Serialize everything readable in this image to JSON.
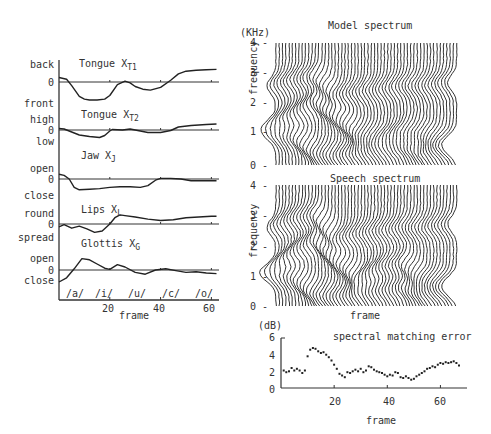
{
  "chart_data": [
    {
      "type": "line",
      "title": "Articulatory parameters",
      "xlabel": "frame",
      "xticks": [
        20,
        40,
        60
      ],
      "xlim": [
        0,
        63
      ],
      "vowel_markers": [
        "/a/",
        "/i/",
        "/u/",
        "/c/",
        "/o/"
      ],
      "panels": [
        {
          "name": "Tongue",
          "sub": "T1",
          "top_label": "back",
          "zero_label": "0",
          "bottom_label": "front",
          "x": [
            0,
            3,
            5,
            8,
            10,
            12,
            15,
            18,
            20,
            23,
            26,
            28,
            30,
            33,
            36,
            40,
            44,
            47,
            50,
            54,
            58,
            62
          ],
          "y": [
            0.5,
            0.3,
            -0.4,
            -1.6,
            -1.9,
            -2.0,
            -2.0,
            -1.9,
            -1.5,
            -0.3,
            0.1,
            -0.1,
            -0.5,
            -0.8,
            -0.9,
            -0.6,
            0.2,
            0.9,
            1.2,
            1.3,
            1.35,
            1.4
          ]
        },
        {
          "name": "Tongue",
          "sub": "T2",
          "top_label": "high",
          "zero_label": "0",
          "bottom_label": "low",
          "x": [
            0,
            2,
            5,
            8,
            12,
            16,
            18,
            20,
            21,
            25,
            28,
            30,
            35,
            40,
            44,
            47,
            52,
            58,
            62
          ],
          "y": [
            0.3,
            0.2,
            -0.4,
            -1.0,
            -1.3,
            -1.5,
            -1.1,
            -0.2,
            0.1,
            0.0,
            0.2,
            0.0,
            -0.5,
            -0.5,
            -0.1,
            0.6,
            0.9,
            1.1,
            1.2
          ]
        },
        {
          "name": "Jaw",
          "sub": "J",
          "top_label": "open",
          "zero_label": "0",
          "bottom_label": "close",
          "x": [
            0,
            2,
            4,
            6,
            8,
            12,
            16,
            20,
            24,
            28,
            32,
            35,
            38,
            40,
            44,
            48,
            52,
            58,
            62
          ],
          "y": [
            0.8,
            0.6,
            0.0,
            -1.4,
            -1.8,
            -1.7,
            -1.6,
            -1.4,
            -1.3,
            -1.3,
            -1.4,
            -1.1,
            -0.2,
            0.1,
            0.1,
            0.0,
            -0.3,
            -0.3,
            -0.3
          ]
        },
        {
          "name": "Lips",
          "sub": "L",
          "top_label": "round",
          "zero_label": "0",
          "bottom_label": "spread",
          "x": [
            0,
            2,
            5,
            8,
            11,
            14,
            17,
            20,
            22,
            24,
            26,
            30,
            35,
            40,
            45,
            50,
            55,
            60,
            62
          ],
          "y": [
            -0.4,
            -0.1,
            -0.6,
            -0.3,
            -0.7,
            -1.2,
            -1.0,
            0.0,
            0.9,
            1.3,
            1.2,
            1.0,
            0.7,
            0.5,
            0.6,
            0.9,
            1.0,
            1.1,
            1.1
          ]
        },
        {
          "name": "Glottis",
          "sub": "G",
          "top_label": "open",
          "zero_label": "0",
          "bottom_label": "close",
          "x": [
            0,
            3,
            6,
            9,
            12,
            15,
            18,
            20,
            23,
            26,
            30,
            34,
            38,
            42,
            46,
            50,
            54,
            58,
            62
          ],
          "y": [
            -2.0,
            -1.3,
            0.2,
            1.9,
            1.7,
            1.0,
            0.3,
            0.1,
            0.9,
            0.5,
            -0.4,
            -0.7,
            0.0,
            0.2,
            -0.1,
            -0.4,
            -0.3,
            -0.5,
            -0.6
          ]
        }
      ]
    },
    {
      "type": "waterfall",
      "title": "Model spectrum",
      "ylabel": "frequency",
      "yunit": "(KHz)",
      "yticks": [
        0,
        1,
        2,
        3,
        4
      ],
      "ylim": [
        0,
        4
      ],
      "formant_tracks": [
        {
          "name": "F1",
          "x": [
            0,
            8,
            15,
            22,
            30,
            38,
            45,
            52,
            60
          ],
          "y": [
            1.0,
            0.9,
            0.4,
            0.3,
            0.4,
            0.5,
            0.6,
            0.4,
            0.5
          ]
        },
        {
          "name": "F2",
          "x": [
            0,
            8,
            15,
            22,
            30,
            38,
            45,
            52,
            60
          ],
          "y": [
            1.3,
            1.7,
            2.1,
            1.6,
            1.0,
            0.9,
            1.1,
            1.0,
            0.8
          ]
        },
        {
          "name": "F3",
          "x": [
            0,
            8,
            15,
            22,
            30,
            38,
            45,
            52,
            60
          ],
          "y": [
            2.6,
            2.8,
            2.9,
            2.3,
            2.4,
            2.5,
            2.6,
            2.6,
            2.7
          ]
        }
      ]
    },
    {
      "type": "waterfall",
      "title": "Speech spectrum",
      "ylabel": "frequency",
      "xlabel": "frame",
      "yticks": [
        0,
        1,
        2,
        3,
        4
      ],
      "ylim": [
        0,
        4
      ],
      "formant_tracks": [
        {
          "name": "F1",
          "x": [
            0,
            8,
            15,
            22,
            30,
            38,
            45,
            52,
            60
          ],
          "y": [
            1.0,
            0.9,
            0.4,
            0.3,
            0.4,
            0.5,
            0.6,
            0.4,
            0.5
          ]
        },
        {
          "name": "F2",
          "x": [
            0,
            8,
            15,
            22,
            30,
            38,
            45,
            52,
            60
          ],
          "y": [
            1.2,
            1.8,
            2.2,
            1.5,
            0.9,
            1.3,
            1.4,
            0.9,
            0.8
          ]
        },
        {
          "name": "F3",
          "x": [
            0,
            8,
            15,
            22,
            30,
            38,
            45,
            52,
            60
          ],
          "y": [
            2.6,
            2.9,
            3.0,
            2.2,
            2.4,
            2.5,
            2.6,
            2.6,
            2.7
          ]
        }
      ]
    },
    {
      "type": "scatter",
      "title": "spectral matching error",
      "xlabel": "frame",
      "ylabel": "(dB)",
      "xticks": [
        20,
        40,
        60
      ],
      "yticks": [
        0,
        2,
        4,
        6
      ],
      "xlim": [
        0,
        70
      ],
      "ylim": [
        0,
        6
      ],
      "x": [
        1,
        2,
        3,
        4,
        5,
        6,
        7,
        8,
        9,
        10,
        11,
        12,
        13,
        14,
        15,
        16,
        17,
        18,
        19,
        20,
        21,
        22,
        23,
        24,
        25,
        26,
        27,
        28,
        29,
        30,
        31,
        32,
        33,
        34,
        35,
        36,
        37,
        38,
        39,
        40,
        41,
        42,
        43,
        44,
        45,
        46,
        47,
        48,
        49,
        50,
        51,
        52,
        53,
        54,
        55,
        56,
        57,
        58,
        59,
        60,
        61,
        62,
        63,
        64,
        65,
        66,
        67
      ],
      "y": [
        2.1,
        1.9,
        2.0,
        2.4,
        2.1,
        2.3,
        2.1,
        1.8,
        2.1,
        3.8,
        4.6,
        4.8,
        4.7,
        4.4,
        4.2,
        4.3,
        4.0,
        3.7,
        3.3,
        2.8,
        2.3,
        1.7,
        1.5,
        1.3,
        1.9,
        1.8,
        2.0,
        2.2,
        2.0,
        2.3,
        1.9,
        2.1,
        2.6,
        2.5,
        2.2,
        2.0,
        1.9,
        1.8,
        1.6,
        1.4,
        1.6,
        1.5,
        1.9,
        1.8,
        1.3,
        1.2,
        1.4,
        1.2,
        1.0,
        1.1,
        1.4,
        1.6,
        1.8,
        2.0,
        2.3,
        2.4,
        2.6,
        2.5,
        2.8,
        3.0,
        2.9,
        3.1,
        3.0,
        3.1,
        3.2,
        3.0,
        2.7
      ]
    }
  ],
  "labels": {
    "left": {
      "panels": [
        {
          "name": "Tongue X",
          "sub": "T1",
          "top": "back",
          "zero": "0",
          "bottom": "front"
        },
        {
          "name": "Tongue X",
          "sub": "T2",
          "top": "high",
          "zero": "0",
          "bottom": "low"
        },
        {
          "name": "Jaw X",
          "sub": "J",
          "top": "open",
          "zero": "0",
          "bottom": "close"
        },
        {
          "name": "Lips X",
          "sub": "L",
          "top": "round",
          "zero": "0",
          "bottom": "spread"
        },
        {
          "name": "Glottis X",
          "sub": "G",
          "top": "open",
          "zero": "0",
          "bottom": "close"
        }
      ],
      "vowels": [
        "/a/",
        "/i/",
        "/u/",
        "/c/",
        "/o/"
      ],
      "xticks": [
        "20",
        "40",
        "60"
      ],
      "xlabel": "frame"
    },
    "model": {
      "title": "Model spectrum",
      "unit": "(KHz)",
      "ylabel": "frequency",
      "yticks": [
        "0",
        "1",
        "2",
        "3",
        "4"
      ]
    },
    "speech": {
      "title": "Speech spectrum",
      "ylabel": "frequency",
      "yticks": [
        "0",
        "1",
        "2",
        "3",
        "4"
      ],
      "xlabel": "frame"
    },
    "error": {
      "title": "spectral matching error",
      "unit": "(dB)",
      "yticks": [
        "0",
        "2",
        "4",
        "6"
      ],
      "xticks": [
        "20",
        "40",
        "60"
      ],
      "xlabel": "frame"
    }
  }
}
